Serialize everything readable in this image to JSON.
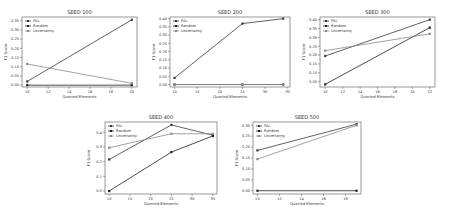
{
  "chart_data": [
    {
      "type": "line",
      "title": "SEED 100",
      "xlabel": "Queried Elements",
      "ylabel": "F1 Score",
      "xlim": [
        9.5,
        20.5
      ],
      "ylim": [
        -0.01,
        0.37
      ],
      "xticks": [
        10,
        12,
        14,
        16,
        18,
        20
      ],
      "yticks": [
        0.0,
        0.05,
        0.1,
        0.15,
        0.2,
        0.25,
        0.3,
        0.35
      ],
      "ytick_labels": [
        "0.00",
        "0.05",
        "0.10",
        "0.15",
        "0.20",
        "0.25",
        "0.30",
        "0.35"
      ],
      "legend_position": "upper left",
      "grid": false,
      "x": [
        10,
        20
      ],
      "series": [
        {
          "name": "PAL",
          "values": [
            0.02,
            0.355
          ]
        },
        {
          "name": "Random",
          "values": [
            0.0,
            0.0
          ]
        },
        {
          "name": "Uncertainty",
          "values": [
            0.115,
            0.01
          ]
        }
      ]
    },
    {
      "type": "line",
      "title": "SEED 200",
      "xlabel": "Queried Elements",
      "ylabel": "F1 Score",
      "xlim": [
        9,
        35.5
      ],
      "ylim": [
        -0.015,
        0.41
      ],
      "xticks": [
        10,
        15,
        20,
        25,
        30,
        35
      ],
      "yticks": [
        0.0,
        0.05,
        0.1,
        0.15,
        0.2,
        0.25,
        0.3,
        0.35,
        0.4
      ],
      "ytick_labels": [
        "0.00",
        "0.05",
        "0.10",
        "0.15",
        "0.20",
        "0.25",
        "0.30",
        "0.35",
        "0.40"
      ],
      "legend_position": "upper left",
      "grid": false,
      "x": [
        10,
        25,
        34
      ],
      "series": [
        {
          "name": "PAL",
          "values": [
            0.04,
            0.37,
            0.4
          ]
        },
        {
          "name": "Random",
          "values": [
            0.0,
            0.0,
            0.0
          ]
        },
        {
          "name": "Uncertainty",
          "values": [
            0.0,
            0.0,
            0.0
          ]
        }
      ]
    },
    {
      "type": "line",
      "title": "SEED 300",
      "xlabel": "Queried Elements",
      "ylabel": "F1 Score",
      "xlim": [
        9.4,
        22.6
      ],
      "ylim": [
        0.02,
        0.415
      ],
      "xticks": [
        10,
        12,
        14,
        16,
        18,
        20,
        22
      ],
      "yticks": [
        0.05,
        0.1,
        0.15,
        0.2,
        0.25,
        0.3,
        0.35,
        0.4
      ],
      "ytick_labels": [
        "0.05",
        "0.10",
        "0.15",
        "0.20",
        "0.25",
        "0.30",
        "0.35",
        "0.40"
      ],
      "legend_position": "upper left",
      "grid": false,
      "x": [
        10,
        22
      ],
      "series": [
        {
          "name": "PAL",
          "values": [
            0.195,
            0.4
          ]
        },
        {
          "name": "Random",
          "values": [
            0.035,
            0.355
          ]
        },
        {
          "name": "Uncertainty",
          "values": [
            0.225,
            0.32
          ]
        }
      ]
    },
    {
      "type": "line",
      "title": "SEED 400",
      "xlabel": "Queried Elements",
      "ylabel": "F1 Score",
      "xlim": [
        9,
        36
      ],
      "ylim": [
        -0.02,
        0.47
      ],
      "xticks": [
        10,
        15,
        20,
        25,
        30,
        35
      ],
      "yticks": [
        0.0,
        0.1,
        0.2,
        0.3,
        0.4
      ],
      "ytick_labels": [
        "0.0",
        "0.1",
        "0.2",
        "0.3",
        "0.4"
      ],
      "legend_position": "upper left",
      "grid": false,
      "x": [
        10,
        25,
        35
      ],
      "series": [
        {
          "name": "PAL",
          "values": [
            0.215,
            0.45,
            0.38
          ]
        },
        {
          "name": "Random",
          "values": [
            0.0,
            0.265,
            0.375
          ]
        },
        {
          "name": "Uncertainty",
          "values": [
            0.295,
            0.39,
            0.39
          ]
        }
      ]
    },
    {
      "type": "line",
      "title": "SEED 500",
      "xlabel": "Queried Elements",
      "ylabel": "F1 Score",
      "xlim": [
        9.6,
        19.4
      ],
      "ylim": [
        -0.015,
        0.315
      ],
      "xticks": [
        10,
        12,
        14,
        16,
        18
      ],
      "yticks": [
        0.0,
        0.05,
        0.1,
        0.15,
        0.2,
        0.25,
        0.3
      ],
      "ytick_labels": [
        "0.00",
        "0.05",
        "0.10",
        "0.15",
        "0.20",
        "0.25",
        "0.30"
      ],
      "legend_position": "upper left",
      "grid": false,
      "x": [
        10,
        19
      ],
      "series": [
        {
          "name": "PAL",
          "values": [
            0.185,
            0.305
          ]
        },
        {
          "name": "Random",
          "values": [
            0.0,
            0.0
          ]
        },
        {
          "name": "Uncertainty",
          "values": [
            0.145,
            0.3
          ]
        }
      ]
    }
  ],
  "style": {
    "series_colors": {
      "PAL": "#3a3a3a",
      "Random": "#1e1e1e",
      "Uncertainty": "#8a8a8a"
    },
    "axis_color": "#555555"
  },
  "layout": [
    {
      "left": 22,
      "top": 17,
      "width": 115,
      "height": 70,
      "box_x": 0,
      "box_y": 0,
      "box_w": 155,
      "box_h": 110
    },
    {
      "left": 170,
      "top": 17,
      "width": 120,
      "height": 70,
      "box_x": 150,
      "box_y": 0,
      "box_w": 155,
      "box_h": 110
    },
    {
      "left": 320,
      "top": 17,
      "width": 115,
      "height": 70,
      "box_x": 300,
      "box_y": 0,
      "box_w": 153,
      "box_h": 110
    },
    {
      "left": 105,
      "top": 122,
      "width": 112,
      "height": 72,
      "box_x": 70,
      "box_y": 108,
      "box_w": 155,
      "box_h": 108
    },
    {
      "left": 253,
      "top": 122,
      "width": 108,
      "height": 72,
      "box_x": 225,
      "box_y": 108,
      "box_w": 155,
      "box_h": 108
    }
  ]
}
